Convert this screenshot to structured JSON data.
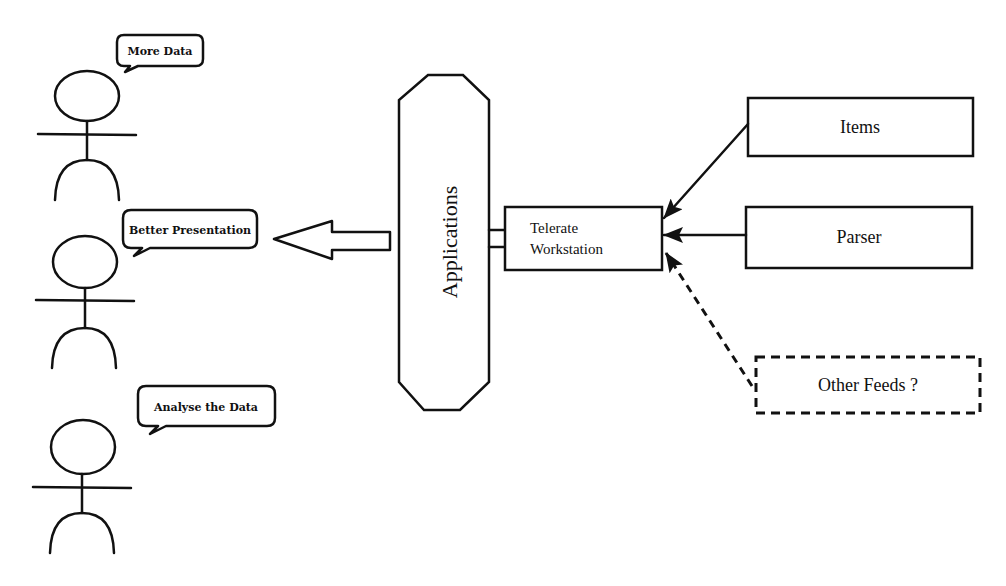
{
  "diagram": {
    "actors": [
      {
        "id": "actor-1",
        "speech": "More Data"
      },
      {
        "id": "actor-2",
        "speech": "Better Presentation"
      },
      {
        "id": "actor-3",
        "speech": "Analyse the Data"
      }
    ],
    "applications": {
      "label": "Applications"
    },
    "workstation": {
      "line1": "Telerate",
      "line2": "Workstation"
    },
    "sources": [
      {
        "label": "Items",
        "style": "solid"
      },
      {
        "label": "Parser",
        "style": "solid"
      },
      {
        "label": "Other Feeds ?",
        "style": "dashed"
      }
    ],
    "colors": {
      "stroke": "#111111",
      "background": "#ffffff"
    }
  }
}
